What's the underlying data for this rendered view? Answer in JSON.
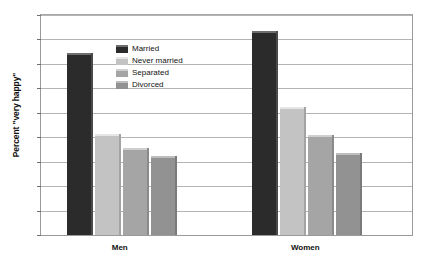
{
  "chart_data": {
    "type": "bar",
    "title": "",
    "subtitle": "",
    "xlabel": "",
    "ylabel": "Percent \"very happy\"",
    "categories": [
      "Men",
      "Women"
    ],
    "series": [
      {
        "name": "Married",
        "values": [
          37.3,
          41.7
        ],
        "color": "#2b2b2b"
      },
      {
        "name": "Never married",
        "values": [
          20.6,
          26.1
        ],
        "color": "#c3c3c3"
      },
      {
        "name": "Separated",
        "values": [
          17.8,
          20.5
        ],
        "color": "#a5a5a5"
      },
      {
        "name": "Divorced",
        "values": [
          16.1,
          16.8
        ],
        "color": "#929292"
      }
    ],
    "ylim": [
      0,
      45
    ],
    "ytick_step": 5,
    "ytick_labels": [
      "0",
      "5",
      "10",
      "15",
      "20",
      "25",
      "30",
      "35",
      "40",
      "45"
    ],
    "grid": true,
    "grid_axis": "y",
    "legend_position": "inside-upper-left",
    "annotations": []
  }
}
